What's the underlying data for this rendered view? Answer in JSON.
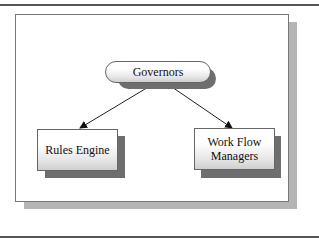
{
  "diagram": {
    "nodes": [
      {
        "id": "governors",
        "label": "Governors",
        "shape": "rounded-pill"
      },
      {
        "id": "rules-engine",
        "label": "Rules Engine",
        "shape": "rectangle"
      },
      {
        "id": "work-flow-managers",
        "label_line1": "Work Flow",
        "label_line2": "Managers",
        "shape": "rectangle"
      }
    ],
    "edges": [
      {
        "from": "governors",
        "to": "rules-engine",
        "arrow": "end"
      },
      {
        "from": "governors",
        "to": "work-flow-managers",
        "arrow": "end"
      }
    ],
    "colors": {
      "node_border": "#666666",
      "shadow": "#6e6e6e",
      "frame_shadow": "#b5b5b5",
      "rule": "#555555"
    }
  }
}
